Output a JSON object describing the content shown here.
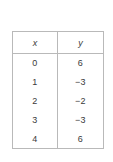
{
  "background_color": "#ffffff",
  "border_color": "#b9b9b9",
  "text_color": "#3a3a3a",
  "table": {
    "name": "xy-value-table",
    "headers": {
      "x": "x",
      "y": "y"
    },
    "rows": [
      {
        "x": "0",
        "y": "6"
      },
      {
        "x": "1",
        "y": "−3"
      },
      {
        "x": "2",
        "y": "−2"
      },
      {
        "x": "3",
        "y": "−3"
      },
      {
        "x": "4",
        "y": "6"
      }
    ]
  },
  "chart_data": {
    "type": "table",
    "title": "",
    "xlabel": "x",
    "ylabel": "y",
    "columns": [
      "x",
      "y"
    ],
    "x": [
      0,
      1,
      2,
      3,
      4
    ],
    "values": [
      6,
      -3,
      -2,
      -3,
      6
    ],
    "series": [
      {
        "name": "y",
        "values": [
          6,
          -3,
          -2,
          -3,
          6
        ]
      }
    ],
    "rows": [
      [
        0,
        6
      ],
      [
        1,
        -3
      ],
      [
        2,
        -2
      ],
      [
        3,
        -3
      ],
      [
        4,
        6
      ]
    ],
    "grid": true,
    "legend": "none"
  }
}
